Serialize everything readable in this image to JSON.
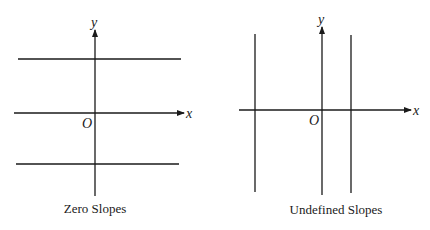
{
  "figures": [
    {
      "id": "zero-slopes",
      "caption": "Zero Slopes",
      "x_axis_label": "x",
      "y_axis_label": "y",
      "origin_label": "O",
      "line_type": "horizontal",
      "line_count": 2,
      "description": "Two horizontal lines, one above and one below the x-axis"
    },
    {
      "id": "undefined-slopes",
      "caption": "Undefined Slopes",
      "x_axis_label": "x",
      "y_axis_label": "y",
      "origin_label": "O",
      "line_type": "vertical",
      "line_count": 2,
      "description": "Two vertical lines, one left and one right of the y-axis"
    }
  ],
  "colors": {
    "stroke": "#1a1a1a",
    "background": "#ffffff"
  }
}
